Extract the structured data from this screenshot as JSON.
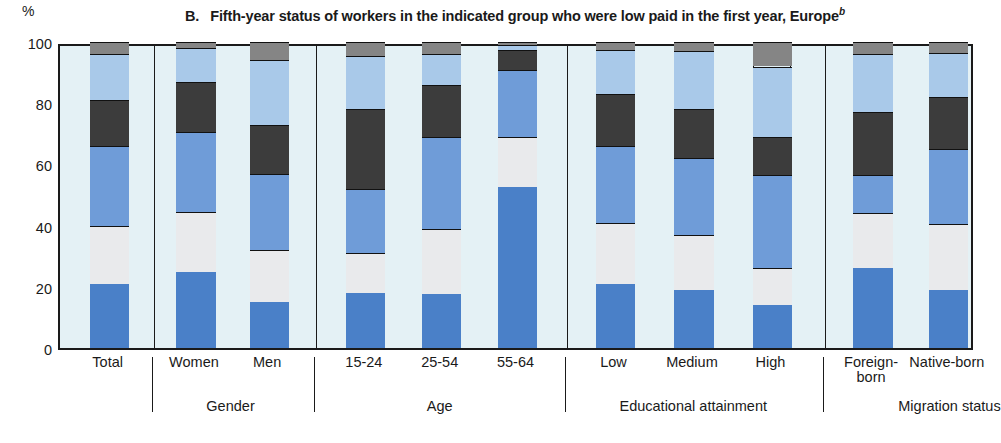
{
  "axis": {
    "unit_label": "%",
    "yticks": [
      0,
      20,
      40,
      60,
      80,
      100
    ],
    "ylim": [
      0,
      100
    ]
  },
  "title": {
    "label": "B.",
    "text": "Fifth-year status of workers in the indicated group who were low paid in the first year, Europe",
    "footnote": "b"
  },
  "colors": {
    "plot_background": "#e4f1f5",
    "seg_low_paid": "#4a80c8",
    "seg_not_employed": "#e9eaec",
    "seg_mid_paid": "#6f9cd8",
    "seg_high_paid": "#3c3c3c",
    "seg_self_employed": "#a9c9e9",
    "seg_other": "#858585",
    "axis": "#1a1a1a"
  },
  "chart_data": {
    "type": "bar",
    "xlabel": "",
    "ylabel": "%",
    "ylim": [
      0,
      100
    ],
    "grid": false,
    "stacked": true,
    "legend": "none",
    "categories": [
      "Total",
      "Women",
      "Men",
      "15-24",
      "25-54",
      "55-64",
      "Low",
      "Medium",
      "High",
      "Foreign-born",
      "Native-born"
    ],
    "groups": [
      {
        "label": "",
        "categories": [
          "Total"
        ]
      },
      {
        "label": "Gender",
        "categories": [
          "Women",
          "Men"
        ]
      },
      {
        "label": "Age",
        "categories": [
          "15-24",
          "25-54",
          "55-64"
        ]
      },
      {
        "label": "Educational attainment",
        "categories": [
          "Low",
          "Medium",
          "High"
        ]
      },
      {
        "label": "Migration status",
        "categories": [
          "Foreign-born",
          "Native-born"
        ]
      }
    ],
    "series": [
      {
        "name": "segment-1",
        "color": "#4a80c8",
        "values": [
          21,
          25,
          15,
          18,
          17.5,
          52.5,
          21,
          19,
          14,
          26,
          19
        ]
      },
      {
        "name": "segment-2",
        "color": "#e9eaec",
        "values": [
          19,
          19.5,
          17,
          13,
          21.5,
          16.5,
          20,
          18,
          12,
          18,
          21.5
        ]
      },
      {
        "name": "segment-3",
        "color": "#6f9cd8",
        "values": [
          26,
          26,
          25,
          21,
          30,
          22,
          25,
          25,
          30.5,
          12.5,
          24.5
        ]
      },
      {
        "name": "segment-4",
        "color": "#3c3c3c",
        "values": [
          15,
          16.5,
          16,
          26,
          17,
          6.5,
          17,
          16,
          12.5,
          20.5,
          17
        ]
      },
      {
        "name": "segment-5",
        "color": "#a9c9e9",
        "values": [
          15,
          11,
          21,
          17.5,
          10,
          1.5,
          14.5,
          19,
          23,
          19,
          14.5
        ]
      },
      {
        "name": "segment-6",
        "color": "#858585",
        "values": [
          4,
          2,
          6,
          4.5,
          4,
          1,
          2.5,
          3,
          8,
          4,
          3.5
        ]
      }
    ],
    "bars": [
      {
        "category": "Total",
        "stops": [
          0,
          21,
          40,
          66,
          81,
          96,
          100
        ]
      },
      {
        "category": "Women",
        "stops": [
          0,
          25,
          44.5,
          70.5,
          87,
          98,
          100
        ]
      },
      {
        "category": "Men",
        "stops": [
          0,
          15,
          32,
          57,
          73,
          94,
          100
        ]
      },
      {
        "category": "15-24",
        "stops": [
          0,
          18,
          31,
          52,
          78,
          95.5,
          100
        ]
      },
      {
        "category": "25-54",
        "stops": [
          0,
          17.5,
          39,
          69,
          86,
          96,
          100
        ]
      },
      {
        "category": "55-64",
        "stops": [
          0,
          52.5,
          69,
          91,
          97.5,
          99,
          100
        ]
      },
      {
        "category": "Low",
        "stops": [
          0,
          21,
          41,
          66,
          83,
          97.5,
          100
        ]
      },
      {
        "category": "Medium",
        "stops": [
          0,
          19,
          37,
          62,
          78,
          97,
          100
        ]
      },
      {
        "category": "High",
        "stops": [
          0,
          14,
          26,
          56.5,
          69,
          92,
          100
        ]
      },
      {
        "category": "Foreign-born",
        "stops": [
          0,
          26,
          44,
          56.5,
          77,
          96,
          100
        ]
      },
      {
        "category": "Native-born",
        "stops": [
          0,
          19,
          40.5,
          65,
          82,
          96.5,
          100
        ]
      }
    ]
  },
  "xaxis": {
    "ticks": [
      {
        "label": "Total",
        "line2": ""
      },
      {
        "label": "Women",
        "line2": ""
      },
      {
        "label": "Men",
        "line2": ""
      },
      {
        "label": "15-24",
        "line2": ""
      },
      {
        "label": "25-54",
        "line2": ""
      },
      {
        "label": "55-64",
        "line2": ""
      },
      {
        "label": "Low",
        "line2": ""
      },
      {
        "label": "Medium",
        "line2": ""
      },
      {
        "label": "High",
        "line2": ""
      },
      {
        "label": "Foreign-",
        "line2": "born"
      },
      {
        "label": "Native-born",
        "line2": ""
      }
    ],
    "group_labels": [
      "Gender",
      "Age",
      "Educational attainment",
      "Migration status"
    ]
  }
}
